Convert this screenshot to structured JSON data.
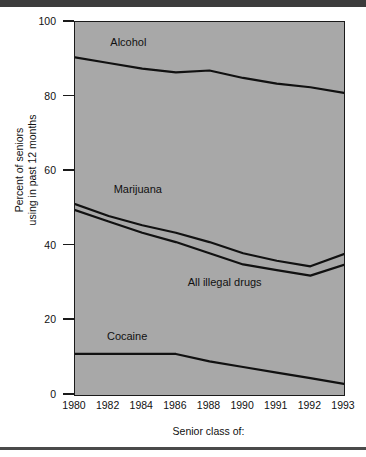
{
  "figure": {
    "top_bar_color": "#3c3c3c",
    "bottom_rule_color": "#4a4a4a",
    "plot_background_color": "#a8a8a8",
    "line_color": "#111111"
  },
  "chart_data": {
    "type": "line",
    "title": "",
    "xlabel": "Senior class of:",
    "ylabel": "Percent of seniors\nusing in past 12 months",
    "ylabel_line1": "Percent of seniors",
    "ylabel_line2": "using in past 12 months",
    "categories": [
      "1980",
      "1982",
      "1984",
      "1986",
      "1988",
      "1990",
      "1991",
      "1992",
      "1993"
    ],
    "x": [
      1980,
      1982,
      1984,
      1986,
      1988,
      1990,
      1991,
      1992,
      1993
    ],
    "ylim": [
      0,
      100
    ],
    "xlim": [
      1980,
      1993
    ],
    "yticks": [
      0,
      20,
      40,
      60,
      80,
      100
    ],
    "ytick_labels": [
      "0",
      "20",
      "40",
      "60",
      "80",
      "100"
    ],
    "grid": false,
    "legend": "inline-labels",
    "series": [
      {
        "name": "Alcohol",
        "label": "Alcohol",
        "label_x": 1982.1,
        "label_y": 94.5,
        "values": [
          90.5,
          89.0,
          87.5,
          86.5,
          87.0,
          85.0,
          83.5,
          82.5,
          81.0
        ]
      },
      {
        "name": "Marijuana",
        "label": "Marijuana",
        "label_x": 1982.3,
        "label_y": 55.0,
        "values": [
          51.2,
          48.0,
          45.5,
          43.5,
          41.0,
          38.0,
          36.0,
          34.5,
          37.8
        ]
      },
      {
        "name": "All illegal drugs",
        "label": "All illegal drugs",
        "label_x": 1986.7,
        "label_y": 30.0,
        "values": [
          49.6,
          46.5,
          43.5,
          41.0,
          38.0,
          35.0,
          33.5,
          32.0,
          34.9
        ]
      },
      {
        "name": "Cocaine",
        "label": "Cocaine",
        "label_x": 1981.9,
        "label_y": 15.5,
        "values": [
          11.0,
          11.0,
          11.0,
          11.0,
          9.0,
          7.5,
          6.0,
          4.5,
          3.0
        ]
      }
    ]
  }
}
